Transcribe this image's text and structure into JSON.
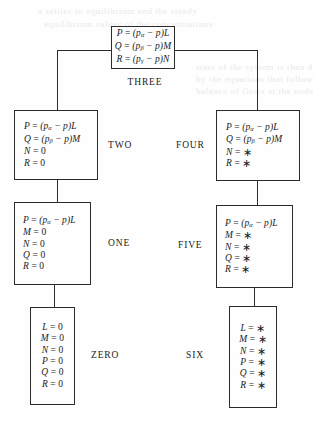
{
  "figure": {
    "kind": "state-transition-ladder-diagram",
    "ghost_text": {
      "l1": "a settles to equilibrium and the steady",
      "l2": "equilibrium values of the concentrations",
      "l3": "state of the system is then described",
      "l4": "by the equations that follow from the",
      "l5": "balance of flows at the nodes"
    },
    "nodes": [
      {
        "id": "three",
        "label": "THREE",
        "label_position": "below",
        "equations": [
          {
            "lhs": "P",
            "rel": "=",
            "rhs": "(p",
            "sub": "α",
            "rhs2": " − p)L"
          },
          {
            "lhs": "Q",
            "rel": "=",
            "rhs": "(p",
            "sub": "β",
            "rhs2": " − p)M"
          },
          {
            "lhs": "R",
            "rel": "=",
            "rhs": "(p",
            "sub": "γ",
            "rhs2": " − p)N"
          }
        ]
      },
      {
        "id": "two",
        "label": "TWO",
        "label_position": "right",
        "equations": [
          {
            "lhs": "P",
            "rel": "=",
            "rhs": "(p",
            "sub": "α",
            "rhs2": " − p)L"
          },
          {
            "lhs": "Q",
            "rel": "=",
            "rhs": "(p",
            "sub": "β",
            "rhs2": " − p)M"
          },
          {
            "lhs": "N",
            "rel": "=",
            "rhs": "0"
          },
          {
            "lhs": "R",
            "rel": "=",
            "rhs": "0"
          }
        ]
      },
      {
        "id": "four",
        "label": "FOUR",
        "label_position": "left",
        "equations": [
          {
            "lhs": "P",
            "rel": "=",
            "rhs": "(p",
            "sub": "α",
            "rhs2": " − p)L"
          },
          {
            "lhs": "Q",
            "rel": "=",
            "rhs": "(p",
            "sub": "β",
            "rhs2": " − p)M"
          },
          {
            "lhs": "N",
            "rel": "=",
            "rhs": "∗"
          },
          {
            "lhs": "R",
            "rel": "=",
            "rhs": "∗"
          }
        ]
      },
      {
        "id": "one",
        "label": "ONE",
        "label_position": "right",
        "equations": [
          {
            "lhs": "P",
            "rel": "=",
            "rhs": "(p",
            "sub": "α",
            "rhs2": " − p)L"
          },
          {
            "lhs": "M",
            "rel": "=",
            "rhs": "0"
          },
          {
            "lhs": "N",
            "rel": "=",
            "rhs": "0"
          },
          {
            "lhs": "Q",
            "rel": "=",
            "rhs": "0"
          },
          {
            "lhs": "R",
            "rel": "=",
            "rhs": "0"
          }
        ]
      },
      {
        "id": "five",
        "label": "FIVE",
        "label_position": "left",
        "equations": [
          {
            "lhs": "P",
            "rel": "=",
            "rhs": "(p",
            "sub": "α",
            "rhs2": " − p)L"
          },
          {
            "lhs": "M",
            "rel": "=",
            "rhs": "∗"
          },
          {
            "lhs": "N",
            "rel": "=",
            "rhs": "∗"
          },
          {
            "lhs": "Q",
            "rel": "=",
            "rhs": "∗"
          },
          {
            "lhs": "R",
            "rel": "=",
            "rhs": "∗"
          }
        ]
      },
      {
        "id": "zero",
        "label": "ZERO",
        "label_position": "right",
        "equations": [
          {
            "lhs": "L",
            "rel": "=",
            "rhs": "0"
          },
          {
            "lhs": "M",
            "rel": "=",
            "rhs": "0"
          },
          {
            "lhs": "N",
            "rel": "=",
            "rhs": "0"
          },
          {
            "lhs": "P",
            "rel": "=",
            "rhs": "0"
          },
          {
            "lhs": "Q",
            "rel": "=",
            "rhs": "0"
          },
          {
            "lhs": "R",
            "rel": "=",
            "rhs": "0"
          }
        ]
      },
      {
        "id": "six",
        "label": "SIX",
        "label_position": "left",
        "equations": [
          {
            "lhs": "L",
            "rel": "=",
            "rhs": "∗"
          },
          {
            "lhs": "M",
            "rel": "=",
            "rhs": "∗"
          },
          {
            "lhs": "N",
            "rel": "=",
            "rhs": "∗"
          },
          {
            "lhs": "P",
            "rel": "=",
            "rhs": "∗"
          },
          {
            "lhs": "Q",
            "rel": "=",
            "rhs": "∗"
          },
          {
            "lhs": "R",
            "rel": "=",
            "rhs": "∗"
          }
        ]
      }
    ]
  }
}
